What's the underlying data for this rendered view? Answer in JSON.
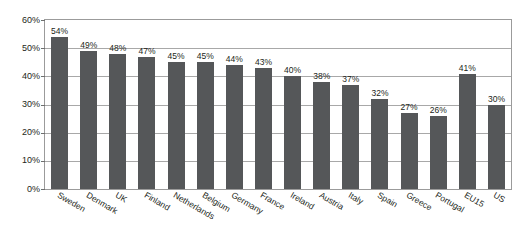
{
  "chart_data": {
    "type": "bar",
    "title": "",
    "subtitle": "",
    "xlabel": "",
    "ylabel": "",
    "ylim": [
      0,
      60
    ],
    "ytick_labels": [
      "0%",
      "10%",
      "20%",
      "30%",
      "40%",
      "50%",
      "60%"
    ],
    "ytick_values": [
      0,
      10,
      20,
      30,
      40,
      50,
      60
    ],
    "grid": true,
    "legend": false,
    "legend_position": "none",
    "value_suffix": "%",
    "bar_color": "#555759",
    "gridline_color": "#a8a8a8",
    "frame_color": "#9b9b9b",
    "text_color": "#231f20",
    "categories": [
      "Sweden",
      "Denmark",
      "UK",
      "Finland",
      "Netherlands",
      "Belgium",
      "Germany",
      "France",
      "Ireland",
      "Austria",
      "Italy",
      "Spain",
      "Greece",
      "Portugal",
      "EU15",
      "US"
    ],
    "values": [
      54,
      49,
      48,
      47,
      45,
      45,
      44,
      43,
      40,
      38,
      37,
      32,
      27,
      26,
      41,
      30
    ],
    "data_labels": [
      "54%",
      "49%",
      "48%",
      "47%",
      "45%",
      "45%",
      "44%",
      "43%",
      "40%",
      "38%",
      "37%",
      "32%",
      "27%",
      "26%",
      "41%",
      "30%"
    ]
  }
}
